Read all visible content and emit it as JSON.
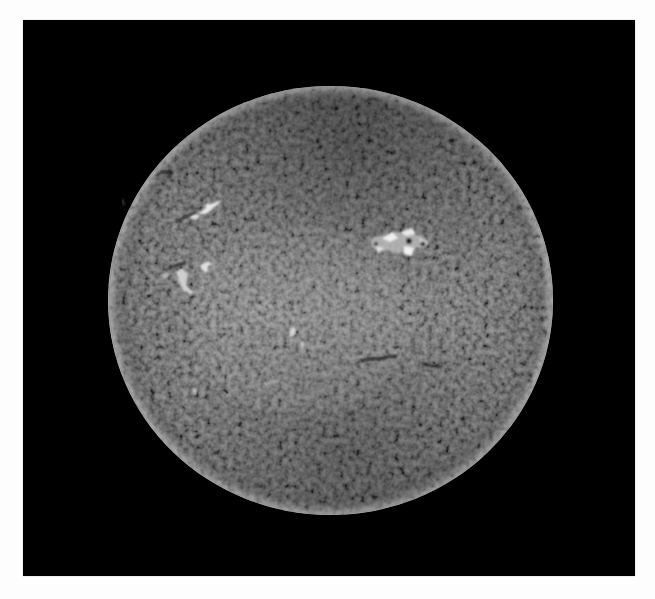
{
  "image": {
    "subject": "Full solar disk in H-alpha",
    "background_color": "#000000",
    "page_background": "#ffffff"
  },
  "sun": {
    "center_x": 330.5,
    "center_y": 300.5,
    "radius_x": 222.5,
    "radius_y": 214.5,
    "disk_color_center": "#6e6e6e",
    "disk_color_limb": "#2a2a2a",
    "limb_highlight": "#9a9a9a"
  },
  "features": {
    "plages": [
      {
        "name": "active-region-northeast-upper",
        "x": 205,
        "y": 210
      },
      {
        "name": "active-region-northeast-lower",
        "x": 180,
        "y": 275
      },
      {
        "name": "active-region-northwest",
        "x": 400,
        "y": 240
      },
      {
        "name": "bright-patch-center",
        "x": 295,
        "y": 335
      }
    ],
    "filaments": [
      {
        "name": "filament-center-right",
        "x1": 360,
        "y1": 360,
        "x2": 397,
        "y2": 357
      },
      {
        "name": "filament-right-small",
        "x1": 422,
        "y1": 364,
        "x2": 442,
        "y2": 367
      },
      {
        "name": "filament-northeast",
        "x1": 158,
        "y1": 174,
        "x2": 172,
        "y2": 172
      },
      {
        "name": "filament-east",
        "x1": 170,
        "y1": 267,
        "x2": 185,
        "y2": 263
      }
    ]
  }
}
